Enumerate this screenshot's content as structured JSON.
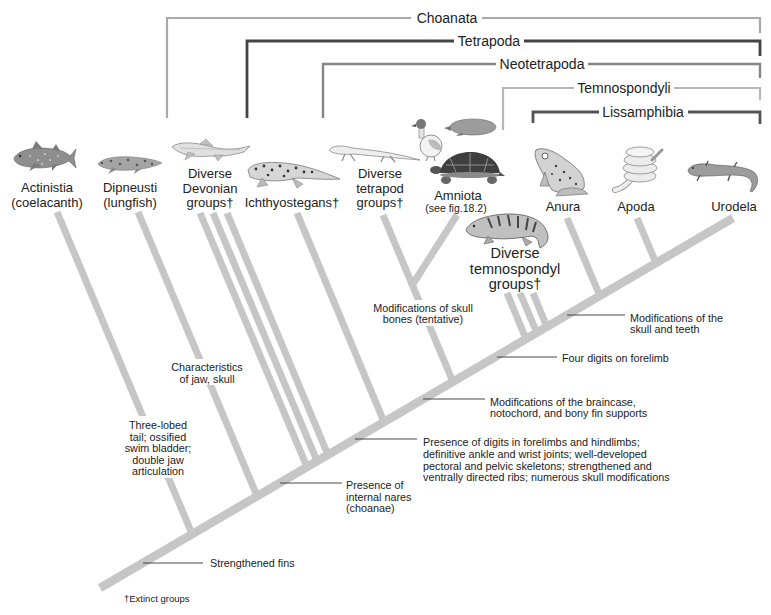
{
  "figure": {
    "clades": [
      {
        "label": "Choanata",
        "color": "#a9a9a9"
      },
      {
        "label": "Tetrapoda",
        "color": "#444444"
      },
      {
        "label": "Neotetrapoda",
        "color": "#858585"
      },
      {
        "label": "Temnospondyli",
        "color": "#b7b7b7"
      },
      {
        "label": "Lissamphibia",
        "color": "#555555"
      }
    ],
    "taxa": [
      {
        "lines": [
          "Actinistia",
          "(coelacanth)"
        ],
        "illustration": "coelacanth"
      },
      {
        "lines": [
          "Dipneusti",
          "(lungfish)"
        ],
        "illustration": "lungfish"
      },
      {
        "lines": [
          "Diverse",
          "Devonian",
          "groups†"
        ],
        "illustration": "devonian-fish",
        "extinct": true
      },
      {
        "lines": [
          "Ichthyostegans†"
        ],
        "illustration": "ichthyostega",
        "extinct": true
      },
      {
        "lines": [
          "Diverse",
          "tetrapod",
          "groups†"
        ],
        "illustration": "early-tetrapod",
        "extinct": true
      },
      {
        "lines": [
          "Amniota",
          "(see fig.18.2)"
        ],
        "illustration": "duck, mole, turtle"
      },
      {
        "lines": [
          "Diverse",
          "temnospondyl",
          "groups†"
        ],
        "illustration": "temnospondyl",
        "extinct": true
      },
      {
        "lines": [
          "Anura"
        ],
        "illustration": "frog"
      },
      {
        "lines": [
          "Apoda"
        ],
        "illustration": "caecilian"
      },
      {
        "lines": [
          "Urodela"
        ],
        "illustration": "salamander"
      }
    ],
    "characters": [
      {
        "lines": [
          "Strengthened fins"
        ]
      },
      {
        "lines": [
          "Three-lobed",
          "tail; ossified",
          "swim bladder;",
          "double jaw",
          "articulation"
        ]
      },
      {
        "lines": [
          "Characteristics",
          "of jaw, skull"
        ]
      },
      {
        "lines": [
          "Presence of",
          "internal nares",
          "(choanae)"
        ]
      },
      {
        "lines": [
          "Presence of digits in forelimbs and hindlimbs;",
          "definitive ankle and wrist joints; well-developed",
          "pectoral and pelvic skeletons; strengthened and",
          "ventrally directed ribs; numerous skull modifications"
        ]
      },
      {
        "lines": [
          "Modifications of the braincase,",
          "notochord, and bony fin supports"
        ]
      },
      {
        "lines": [
          "Modifications of skull",
          "bones (tentative)"
        ]
      },
      {
        "lines": [
          "Four digits on forelimb"
        ]
      },
      {
        "lines": [
          "Modifications of the",
          "skull and teeth"
        ]
      }
    ],
    "footnote": "†Extinct groups",
    "branch_color": "#c6c6c6"
  }
}
